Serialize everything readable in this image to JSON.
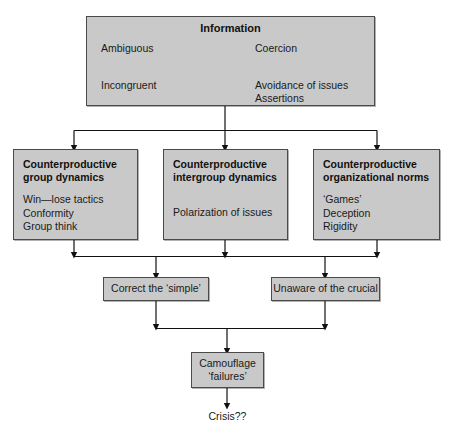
{
  "diagram": {
    "type": "flowchart",
    "background_color": "#ffffff",
    "box_fill_color": "#c9c9c9",
    "box_border_color": "#4a4a4a",
    "text_color": "#1a1a1a"
  },
  "information_box": {
    "title": "Information",
    "left_top": "Ambiguous",
    "right_top": "Coercion",
    "left_bottom": "Incongruent",
    "right_bottom_1": "Avoidance of issues",
    "right_bottom_2": "Assertions",
    "arrow": "double-headed-horizontal-arrow"
  },
  "middle_boxes": [
    {
      "title_line_1": "Counterproductive",
      "title_line_2": "group dynamics",
      "items": [
        "Win—lose tactics",
        "Conformity",
        "Group think"
      ]
    },
    {
      "title_line_1": "Counterproductive",
      "title_line_2": "intergroup dynamics",
      "items": [
        "Polarization of issues"
      ]
    },
    {
      "title_line_1": "Counterproductive",
      "title_line_2": "organizational norms",
      "items": [
        "‘Games’",
        "Deception",
        "Rigidity"
      ]
    }
  ],
  "lower_boxes": [
    {
      "label": "Correct the  ‘simple’"
    },
    {
      "label": "Unaware of the crucial"
    }
  ],
  "camouflage_box": {
    "line_1": "Camouflage",
    "line_2": "‘failures’"
  },
  "outcome": {
    "label": "Crisis??"
  }
}
